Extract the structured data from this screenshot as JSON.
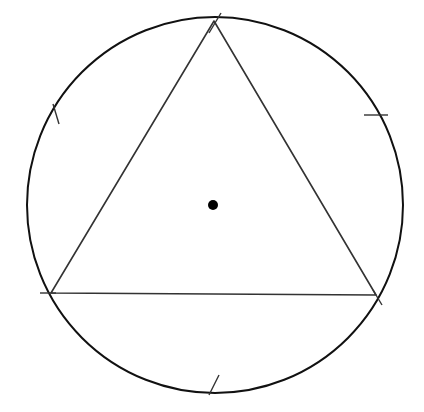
{
  "diagram": {
    "title": "",
    "colors": {
      "background": "#ffffff",
      "circle_stroke": "#111111",
      "triangle_stroke": "#333333",
      "tick_stroke": "#333333",
      "center_fill": "#000000"
    },
    "circle": {
      "cx": 215,
      "cy": 205,
      "r": 188,
      "stroke_width": 2
    },
    "center_point": {
      "cx": 213,
      "cy": 205,
      "r": 5
    },
    "triangle": {
      "vertices": [
        {
          "label": "",
          "x": 214,
          "y": 21
        },
        {
          "label": "",
          "x": 51,
          "y": 293
        },
        {
          "label": "",
          "x": 376,
          "y": 295
        }
      ],
      "stroke_width": 1.6
    },
    "tick_marks": [
      {
        "x1": 209,
        "y1": 33,
        "x2": 221,
        "y2": 13
      },
      {
        "x1": 53,
        "y1": 104,
        "x2": 59,
        "y2": 124
      },
      {
        "x1": 364,
        "y1": 115,
        "x2": 388,
        "y2": 115
      },
      {
        "x1": 40,
        "y1": 293,
        "x2": 56,
        "y2": 293
      },
      {
        "x1": 373,
        "y1": 290,
        "x2": 382,
        "y2": 305
      },
      {
        "x1": 209,
        "y1": 395,
        "x2": 219,
        "y2": 375
      }
    ]
  }
}
